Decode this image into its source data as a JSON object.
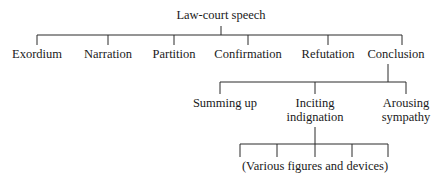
{
  "diagram": {
    "type": "tree",
    "root": {
      "label": "Law-court speech",
      "children": [
        {
          "label": "Exordium"
        },
        {
          "label": "Narration"
        },
        {
          "label": "Partition"
        },
        {
          "label": "Confirmation"
        },
        {
          "label": "Refutation"
        },
        {
          "label": "Conclusion",
          "children": [
            {
              "label": "Summing up"
            },
            {
              "label_line1": "Inciting",
              "label_line2": "indignation",
              "children": [
                {
                  "label": "(Various figures and devices)"
                }
              ]
            },
            {
              "label_line1": "Arousing",
              "label_line2": "sympathy"
            }
          ]
        }
      ]
    }
  }
}
